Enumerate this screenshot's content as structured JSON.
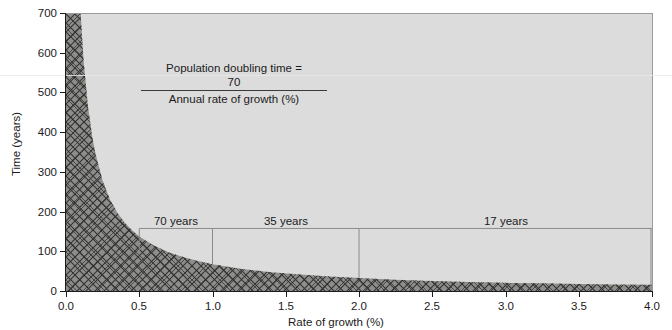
{
  "chart_data": {
    "type": "line",
    "title": "",
    "subtitle": "",
    "xlabel": "Rate of growth (%)",
    "ylabel": "Time (years)",
    "xlim": [
      0.0,
      4.0
    ],
    "ylim": [
      0,
      700
    ],
    "xticks": [
      "0.0",
      "0.5",
      "1.0",
      "1.5",
      "2.0",
      "2.5",
      "3.0",
      "3.5",
      "4.0"
    ],
    "xtick_values": [
      0.0,
      0.5,
      1.0,
      1.5,
      2.0,
      2.5,
      3.0,
      3.5,
      4.0
    ],
    "yticks": [
      "0",
      "100",
      "200",
      "300",
      "400",
      "500",
      "600",
      "700"
    ],
    "ytick_values": [
      0,
      100,
      200,
      300,
      400,
      500,
      600,
      700
    ],
    "grid": false,
    "legend": "none",
    "formula": "y = 70 / x",
    "series": [
      {
        "name": "Population doubling time",
        "fill": "cross-hatch",
        "x": [
          0.1,
          0.12,
          0.15,
          0.18,
          0.2,
          0.25,
          0.3,
          0.35,
          0.4,
          0.45,
          0.5,
          0.6,
          0.7,
          0.8,
          0.9,
          1.0,
          1.2,
          1.4,
          1.6,
          1.8,
          2.0,
          2.25,
          2.5,
          2.75,
          3.0,
          3.25,
          3.5,
          3.75,
          4.0
        ],
        "y": [
          700,
          583,
          467,
          389,
          350,
          280,
          233,
          200,
          175,
          156,
          140,
          117,
          100,
          88,
          78,
          70,
          58,
          50,
          44,
          39,
          35,
          31,
          28,
          25,
          23,
          22,
          20,
          19,
          18
        ]
      }
    ],
    "annotations": [
      {
        "name": "doubling-time-formula",
        "numerator_label": "Population doubling time =",
        "numerator_value": "70",
        "denominator": "Annual rate of growth (%)"
      },
      {
        "name": "marker-70-years",
        "label": "70 years",
        "x": 1.0,
        "y": 70,
        "connector_y": 160
      },
      {
        "name": "marker-35-years",
        "label": "35 years",
        "x": 2.0,
        "y": 35,
        "connector_y": 160
      },
      {
        "name": "marker-17-years",
        "label": "17 years",
        "x": 4.0,
        "y": 17,
        "connector_y": 160
      }
    ],
    "colors": {
      "plot_background": "#dcdcdc",
      "hatch_fill": "#808080",
      "hatch_line": "#3c3c3c",
      "axis": "#1b1b1b",
      "connector_line": "#8a8a8a",
      "text": "#1b1b1b"
    }
  },
  "axes": {
    "y_title": "Time (years)",
    "x_title": "Rate of growth (%)",
    "y_tick_labels": [
      "700",
      "600",
      "500",
      "400",
      "300",
      "200",
      "100",
      "0"
    ],
    "x_tick_labels": [
      "0.0",
      "0.5",
      "1.0",
      "1.5",
      "2.0",
      "2.5",
      "3.0",
      "3.5",
      "4.0"
    ]
  },
  "formula": {
    "numerator_text": "Population doubling time =",
    "numerator_value": "70",
    "denominator_text": "Annual rate of growth (%)"
  },
  "markers": {
    "m70": "70 years",
    "m35": "35 years",
    "m17": "17 years"
  }
}
